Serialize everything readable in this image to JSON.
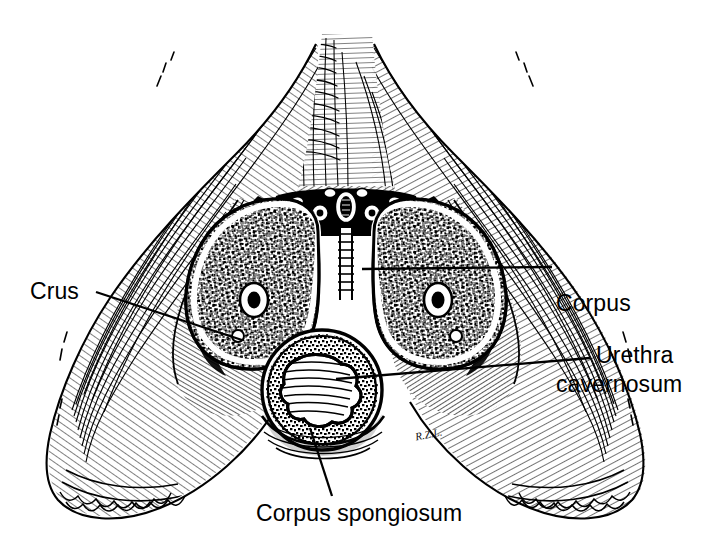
{
  "figure": {
    "style": "pen-and-ink line illustration",
    "background_color": "#ffffff",
    "ink_color": "#000000",
    "signature": "R.Z.L."
  },
  "labels": {
    "corpus_cavernosum": {
      "line1": "Corpus",
      "line2": "cavernosum",
      "leader": "horizontal leader line to right corpus cavernosum"
    },
    "crus": {
      "text": "Crus",
      "leader": "diagonal leader line down-right to left crus"
    },
    "urethra": {
      "text": "Urethra",
      "leader": "leader line left to urethral lumen"
    },
    "corpus_spongiosum": {
      "text": "Corpus spongiosum",
      "leader": "leader line up to corpus spongiosum"
    }
  },
  "structures": [
    {
      "name": "corpus-cavernosum-left",
      "description": "left erectile body, cavernous spongy tissue with central deep artery"
    },
    {
      "name": "corpus-cavernosum-right",
      "description": "right erectile body, cavernous spongy tissue with central deep artery"
    },
    {
      "name": "corpus-spongiosum",
      "description": "ventral erectile body enclosing the urethra"
    },
    {
      "name": "urethra-lumen",
      "description": "stellate urethral lumen within corpus spongiosum"
    },
    {
      "name": "dorsal-vein",
      "description": "deep dorsal vein of the penis, midline"
    },
    {
      "name": "dorsal-arteries",
      "description": "paired dorsal arteries flanking the vein"
    },
    {
      "name": "dorsal-nerves",
      "description": "dorsal nerves of the penis, lateral to the arteries"
    },
    {
      "name": "ischiocavernosus-muscle-left",
      "description": "hatched muscle mass, left"
    },
    {
      "name": "ischiocavernosus-muscle-right",
      "description": "hatched muscle mass, right"
    },
    {
      "name": "thigh-soft-tissue-left",
      "description": "medial thigh soft tissue, left"
    },
    {
      "name": "thigh-soft-tissue-right",
      "description": "medial thigh soft tissue, right"
    }
  ]
}
